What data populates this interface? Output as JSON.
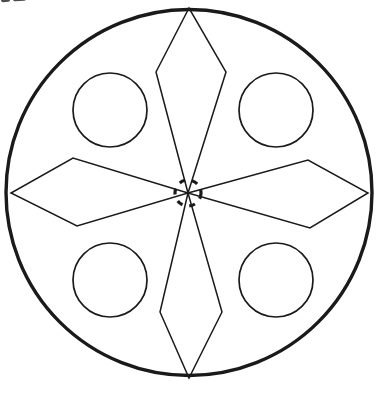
{
  "document": {
    "title": "Rosette Line Drawing",
    "kind": "line-art geometric figure",
    "background_color": "#ffffff",
    "width": 378,
    "height": 396
  },
  "figure": {
    "name": "four-petal rosette in circle",
    "stroke_color": "#1a1a1a",
    "fill_color": "none",
    "outer_circle": {
      "label": "outer boundary circle",
      "cx": 189,
      "cy": 192.5,
      "r": 183,
      "stroke_width": 3.4
    },
    "center_marker": {
      "label": "dashed hub circle",
      "cx": 188,
      "cy": 193,
      "r": 13,
      "stroke_width": 3.2,
      "dash_pattern": "6 7"
    },
    "petals": [
      {
        "name": "vertical-petal-upper",
        "orientation": "vertical",
        "points": "188,193 156,72 189,8 226,72"
      },
      {
        "name": "vertical-petal-lower",
        "orientation": "vertical",
        "points": "188,193 160,312 189,378 222,312"
      },
      {
        "name": "horizontal-petal-left",
        "orientation": "horizontal",
        "points": "188,193 73,158 11,193 77,226"
      },
      {
        "name": "horizontal-petal-right",
        "orientation": "horizontal",
        "points": "188,193 308,160 368,193 310,228"
      }
    ],
    "quadrant_circles": [
      {
        "name": "quadrant-circle-top-left",
        "cx": 110,
        "cy": 110,
        "r": 37,
        "stroke_width": 1.7
      },
      {
        "name": "quadrant-circle-top-right",
        "cx": 276,
        "cy": 110,
        "r": 37,
        "stroke_width": 1.7
      },
      {
        "name": "quadrant-circle-bottom-left",
        "cx": 110,
        "cy": 280,
        "r": 37,
        "stroke_width": 1.7
      },
      {
        "name": "quadrant-circle-bottom-right",
        "cx": 276,
        "cy": 280,
        "r": 37,
        "stroke_width": 1.7
      }
    ],
    "petal_stroke_width": 1.5,
    "scan_artifacts": [
      {
        "name": "smudge-a"
      },
      {
        "name": "smudge-b"
      },
      {
        "name": "smudge-c"
      }
    ]
  }
}
